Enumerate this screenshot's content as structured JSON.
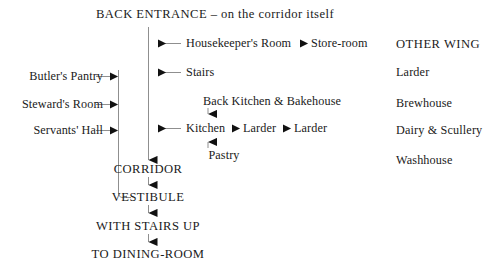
{
  "diagram": {
    "title": "BACK ENTRANCE – on the corridor itself",
    "corridor_branches": [
      {
        "label": "Housekeeper's Room",
        "source": "Store-room"
      },
      {
        "label": "Stairs",
        "source": null
      },
      {
        "label": "Kitchen",
        "source": "Larder",
        "source2": "Larder"
      }
    ],
    "kitchen_above": "Back Kitchen & Bakehouse",
    "kitchen_below": "Pastry",
    "store_room": "Store-room",
    "larder_mid": "Larder",
    "larder_far": "Larder",
    "left_rooms": [
      "Butler's Pantry",
      "Steward's Room",
      "Servants' Hall"
    ],
    "spine": [
      "CORRIDOR",
      "VESTIBULE",
      "WITH STAIRS UP",
      "TO DINING-ROOM"
    ],
    "other_wing": {
      "heading": "OTHER WING",
      "rooms": [
        "Larder",
        "Brewhouse",
        "Dairy & Scullery",
        "Washhouse"
      ]
    },
    "colors": {
      "ink": "#1a1a1a",
      "rule": "#9a9a9a",
      "background": "#ffffff"
    }
  }
}
